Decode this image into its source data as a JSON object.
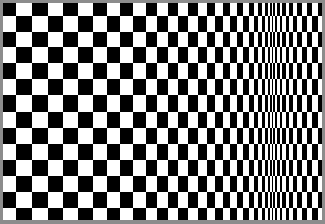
{
  "image": {
    "description": "Op-art checkerboard where column widths compress toward a vertical line near the right side, creating an illusion of movement",
    "colors": {
      "dark": "#000000",
      "light": "#ffffff",
      "border": "#8c8c8c"
    },
    "border_px": 3,
    "first_cell_dark": true,
    "column_widths": [
      13,
      16,
      16,
      15,
      15,
      15,
      14,
      13,
      13,
      13,
      11,
      11,
      10,
      10,
      10,
      9,
      8,
      8,
      7,
      7,
      6,
      6,
      5,
      4,
      4,
      3,
      3,
      2,
      2,
      1,
      2,
      2,
      3,
      2,
      4,
      3,
      4,
      4,
      5,
      5,
      5,
      6,
      4
    ],
    "row_heights": [
      13,
      16,
      15,
      16,
      16,
      16,
      17,
      16,
      16,
      16,
      16,
      16,
      16,
      12
    ]
  }
}
